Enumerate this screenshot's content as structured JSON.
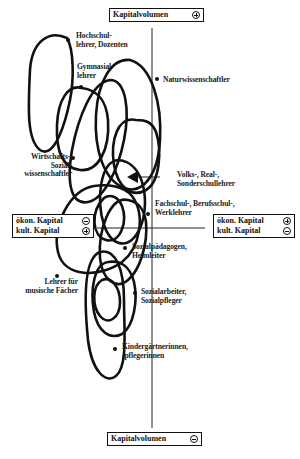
{
  "axes": {
    "top_label": "Kapitalvolumen",
    "top_sign": "plus",
    "bottom_label": "Kapitalvolumen",
    "bottom_sign": "minus",
    "left_box": {
      "row1_label": "ökon. Kapital",
      "row1_sign": "minus",
      "row2_label": "kult. Kapital",
      "row2_sign": "plus"
    },
    "right_box": {
      "row1_label": "ökon. Kapital",
      "row1_sign": "plus",
      "row2_label": "kult. Kapital",
      "row2_sign": "minus"
    }
  },
  "groups": [
    {
      "id": "hochschullehrer",
      "label_line1": "Hochschul-",
      "label_line2": "lehrer, Dozenten"
    },
    {
      "id": "gymnasiallehrer",
      "label_line1": "Gymnasial-",
      "label_line2": "lehrer"
    },
    {
      "id": "naturwissenschaftler",
      "label_line1": "Naturwissenschaftler"
    },
    {
      "id": "wirtschafts_sozialwissenschaftler",
      "label_line1": "Wirtschafts-,",
      "label_line2": "Sozial-",
      "label_line3": "wissenschaftler"
    },
    {
      "id": "volks_real_sonderschullehrer",
      "label_line1": "Volks-, Real-,",
      "label_line2": "Sonderschullehrer"
    },
    {
      "id": "fachschul_berufsschul_werklehrer",
      "label_line1": "Fachschul-, Berufsschul-,",
      "label_line2": "Werklehrer"
    },
    {
      "id": "sozialpaedagogen_heimleiter",
      "label_line1": "Sozialpädagogen,",
      "label_line2": "Heimleiter"
    },
    {
      "id": "lehrer_musische_faecher",
      "label_line1": "Lehrer für",
      "label_line2": "musische Fächer"
    },
    {
      "id": "sozialarbeiter_sozialpfleger",
      "label_line1": "Sozialarbeiter,",
      "label_line2": "Sozialpfleger"
    },
    {
      "id": "kindergaertnerinnen",
      "label_line1": "Kindergärtnerinnen,",
      "label_line2": "-pflegerinnen"
    }
  ],
  "colors": {
    "ink": "#111111",
    "background": "#ffffff"
  }
}
